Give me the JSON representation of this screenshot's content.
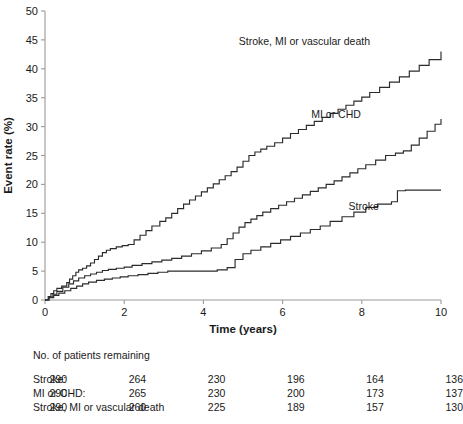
{
  "chart_data": {
    "type": "line",
    "title": "",
    "xlabel": "Time (years)",
    "ylabel": "Event rate (%)",
    "xlim": [
      0,
      10
    ],
    "ylim": [
      0,
      50
    ],
    "xticks": [
      0,
      2,
      4,
      6,
      8,
      10
    ],
    "yticks": [
      0,
      5,
      10,
      15,
      20,
      25,
      30,
      35,
      40,
      45,
      50
    ],
    "grid": false,
    "legend_position": "inline-annotations",
    "line_color": "#2b2b2b",
    "series": [
      {
        "name": "Stroke, MI or vascular death",
        "label_x": 6.55,
        "label_y": 44.2,
        "final_value": 43.0,
        "x": [
          0,
          0.08,
          0.15,
          0.22,
          0.3,
          0.42,
          0.55,
          0.62,
          0.7,
          0.78,
          0.85,
          0.95,
          1.05,
          1.15,
          1.25,
          1.35,
          1.45,
          1.55,
          1.65,
          1.8,
          1.95,
          2.1,
          2.25,
          2.4,
          2.55,
          2.7,
          2.9,
          3.05,
          3.2,
          3.35,
          3.5,
          3.65,
          3.8,
          3.95,
          4.1,
          4.25,
          4.4,
          4.55,
          4.7,
          4.85,
          5.0,
          5.15,
          5.3,
          5.45,
          5.6,
          5.8,
          6.0,
          6.2,
          6.4,
          6.6,
          6.8,
          7.0,
          7.2,
          7.4,
          7.6,
          7.8,
          8.0,
          8.2,
          8.45,
          8.7,
          8.95,
          9.2,
          9.45,
          9.7,
          10.0
        ],
        "y": [
          0,
          0.6,
          1.1,
          1.6,
          2.0,
          2.4,
          3.0,
          3.6,
          4.2,
          4.8,
          5.2,
          5.5,
          5.9,
          6.4,
          7.0,
          7.6,
          8.2,
          8.6,
          8.9,
          9.2,
          9.4,
          9.6,
          10.4,
          11.2,
          12.0,
          12.8,
          13.6,
          14.2,
          15.0,
          15.8,
          16.6,
          17.3,
          18.0,
          18.7,
          19.4,
          20.1,
          20.8,
          21.5,
          22.2,
          23.0,
          24.0,
          25.0,
          25.6,
          26.1,
          26.6,
          27.2,
          28.0,
          28.8,
          29.5,
          30.2,
          30.9,
          31.6,
          32.3,
          33.0,
          33.7,
          34.4,
          35.1,
          35.9,
          36.8,
          37.7,
          38.6,
          39.6,
          40.6,
          41.6,
          43.0
        ]
      },
      {
        "name": "MI or CHD",
        "label_x": 7.35,
        "label_y": 31.5,
        "final_value": 31.3,
        "x": [
          0,
          0.1,
          0.2,
          0.3,
          0.45,
          0.6,
          0.72,
          0.85,
          1.0,
          1.15,
          1.3,
          1.45,
          1.6,
          1.8,
          2.0,
          2.2,
          2.45,
          2.7,
          2.95,
          3.2,
          3.45,
          3.7,
          3.95,
          4.2,
          4.45,
          4.6,
          4.75,
          4.9,
          5.05,
          5.2,
          5.35,
          5.5,
          5.7,
          5.9,
          6.1,
          6.3,
          6.5,
          6.7,
          6.9,
          7.1,
          7.3,
          7.5,
          7.7,
          7.9,
          8.1,
          8.35,
          8.6,
          8.85,
          9.05,
          9.25,
          9.45,
          9.65,
          9.85,
          10.0
        ],
        "y": [
          0,
          0.5,
          1.0,
          1.5,
          2.2,
          2.8,
          3.3,
          3.8,
          4.2,
          4.5,
          4.8,
          5.1,
          5.3,
          5.5,
          5.7,
          6.0,
          6.3,
          6.6,
          6.9,
          7.2,
          7.6,
          8.0,
          8.5,
          9.0,
          9.6,
          10.6,
          11.6,
          12.6,
          13.4,
          14.0,
          14.6,
          15.2,
          15.8,
          16.4,
          17.0,
          17.6,
          18.2,
          18.8,
          19.4,
          20.0,
          20.6,
          21.3,
          22.0,
          22.7,
          23.4,
          24.2,
          25.0,
          25.4,
          25.8,
          26.8,
          28.0,
          29.2,
          30.4,
          31.3
        ]
      },
      {
        "name": "Stroke",
        "label_x": 8.05,
        "label_y": 15.6,
        "final_value": 19.0,
        "x": [
          0,
          0.1,
          0.22,
          0.35,
          0.5,
          0.65,
          0.8,
          0.95,
          1.1,
          1.3,
          1.5,
          1.7,
          1.9,
          2.1,
          2.35,
          2.6,
          2.85,
          3.1,
          3.35,
          3.6,
          3.85,
          4.1,
          4.35,
          4.6,
          4.8,
          5.0,
          5.2,
          5.45,
          5.7,
          5.95,
          6.2,
          6.45,
          6.7,
          6.95,
          7.2,
          7.5,
          7.8,
          8.1,
          8.4,
          8.75,
          8.9,
          9.1,
          10.0
        ],
        "y": [
          0,
          0.4,
          0.8,
          1.2,
          1.6,
          2.0,
          2.4,
          2.8,
          3.1,
          3.4,
          3.6,
          3.8,
          4.0,
          4.2,
          4.4,
          4.6,
          4.8,
          5.0,
          5.0,
          5.0,
          5.0,
          5.0,
          5.2,
          5.6,
          7.0,
          8.0,
          8.6,
          9.2,
          9.8,
          10.4,
          11.0,
          11.6,
          12.2,
          12.8,
          13.6,
          14.4,
          15.2,
          16.0,
          16.6,
          17.0,
          18.9,
          19.0,
          19.0
        ]
      }
    ]
  },
  "risk_table": {
    "caption": "No. of patients remaining",
    "columns_x_years": [
      0,
      2,
      4,
      6,
      8,
      10
    ],
    "rows": [
      {
        "label": "Stroke:",
        "values": [
          "290",
          "264",
          "230",
          "196",
          "164",
          "136"
        ]
      },
      {
        "label": "MI or CHD:",
        "values": [
          "290",
          "265",
          "230",
          "200",
          "173",
          "137"
        ]
      },
      {
        "label": "Stroke, MI or vascular death",
        "values": [
          "290",
          "260",
          "225",
          "189",
          "157",
          "130"
        ]
      }
    ]
  }
}
